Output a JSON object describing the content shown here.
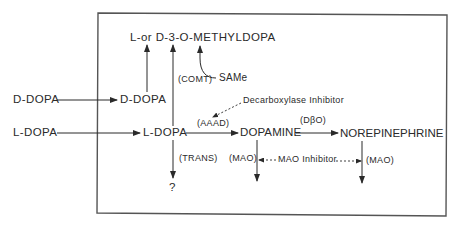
{
  "diagram": {
    "title_compound": "L-or D-3-O-METHYLDOPA",
    "cofactor": "SAMe",
    "enzymes": {
      "comt": "(COMT)",
      "aaad": "(AAAD)",
      "dbo": "(DβO)",
      "trans": "(TRANS)",
      "mao_left": "(MAO)",
      "mao_right": "(MAO)"
    },
    "inputs": {
      "d_dopa_outer": "D-DOPA",
      "l_dopa_outer": "L-DOPA"
    },
    "nodes": {
      "d_dopa_inner": "D-DOPA",
      "l_dopa_inner": "L-DOPA",
      "dopamine": "DOPAMINE",
      "norepinephrine": "NOREPINEPHRINE",
      "unknown": "?"
    },
    "inhibitors": {
      "decarboxylase": "Decarboxylase Inhibitor",
      "mao": "MAO Inhibitor"
    },
    "colors": {
      "line": "#2a2a2a",
      "box": "#555555",
      "background": "#ffffff"
    }
  }
}
